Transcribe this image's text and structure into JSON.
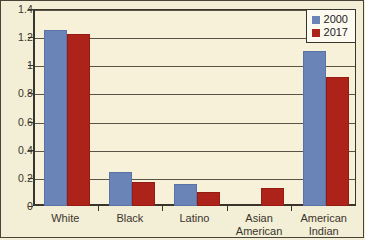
{
  "chart_data": {
    "type": "bar",
    "title": "",
    "subtitle": "",
    "xlabel": "",
    "ylabel": "",
    "categories": [
      "White",
      "Black",
      "Latino",
      "Asian American",
      "American Indian"
    ],
    "category_lines": [
      [
        "White"
      ],
      [
        "Black"
      ],
      [
        "Latino"
      ],
      [
        "Asian",
        "American"
      ],
      [
        "American",
        "Indian"
      ]
    ],
    "series": [
      {
        "name": "2000",
        "color": "#6b84b8",
        "values": [
          1.25,
          0.24,
          0.155,
          null,
          1.1
        ]
      },
      {
        "name": "2017",
        "color": "#ad2219",
        "values": [
          1.22,
          0.17,
          0.1,
          0.13,
          0.915
        ]
      }
    ],
    "ylim": [
      0,
      1.4
    ],
    "yticks": [
      0,
      0.2,
      0.4,
      0.6,
      0.8,
      1,
      1.2,
      1.4
    ],
    "ytick_labels": [
      "0",
      "0.2",
      "0.4",
      "0.6",
      "0.8",
      "1",
      "1.2",
      "1.4"
    ],
    "grid": true,
    "grid_axis": "y",
    "legend_position": "top-right",
    "legend_entries": [
      "2000",
      "2017"
    ],
    "annotations": [],
    "background_color": "#f3eed6",
    "plot_background_color": "#f7f1da",
    "axis_color": "#3a352c"
  }
}
